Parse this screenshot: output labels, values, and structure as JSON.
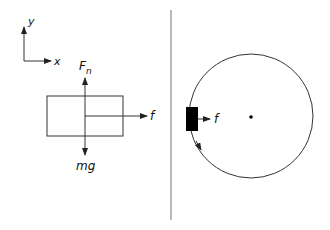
{
  "diagram": {
    "axes": {
      "x_label": "x",
      "y_label": "y"
    },
    "free_body": {
      "normal_force": {
        "symbol": "F",
        "subscript": "n"
      },
      "weight": {
        "label": "mg"
      },
      "friction": {
        "label": "f"
      }
    },
    "circular_motion": {
      "friction": {
        "label": "f"
      }
    },
    "colors": {
      "stroke": "#333333",
      "block": "#000000",
      "divider": "#888888"
    }
  }
}
